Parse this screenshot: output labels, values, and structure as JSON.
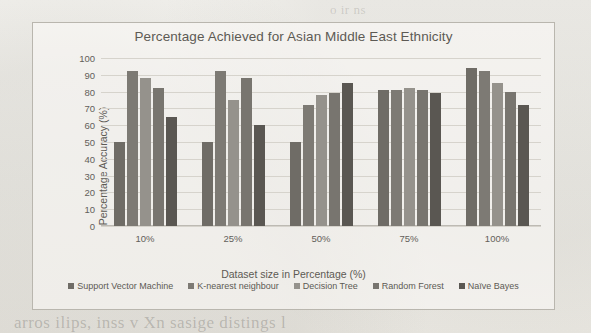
{
  "chart_data": {
    "type": "bar",
    "title": "Percentage Achieved for Asian Middle East Ethnicity",
    "xlabel": "Dataset size in Percentage (%)",
    "ylabel": "Percentage Accuracy (%)",
    "categories": [
      "10%",
      "25%",
      "50%",
      "75%",
      "100%"
    ],
    "ylim": [
      0,
      100
    ],
    "yticks": [
      100,
      90,
      80,
      70,
      60,
      50,
      40,
      30,
      20,
      10,
      0
    ],
    "grid": true,
    "legend_position": "bottom",
    "series": [
      {
        "name": "Support Vector Machine",
        "color": "#6f6c66",
        "values": [
          50,
          50,
          50,
          81,
          94
        ]
      },
      {
        "name": "K-nearest neighbour",
        "color": "#7d7a74",
        "values": [
          92,
          92,
          72,
          81,
          92
        ]
      },
      {
        "name": "Decision Tree",
        "color": "#95928c",
        "values": [
          88,
          75,
          78,
          82,
          85
        ]
      },
      {
        "name": "Random Forest",
        "color": "#78756f",
        "values": [
          82,
          88,
          79,
          81,
          80
        ]
      },
      {
        "name": "Naïve Bayes",
        "color": "#5a5752",
        "values": [
          65,
          60,
          85,
          79,
          72
        ]
      }
    ]
  },
  "page": {
    "bleed_bottom": "arros ilips, inss v Xn sasige distings l",
    "bleed_top": "o ir ns"
  }
}
